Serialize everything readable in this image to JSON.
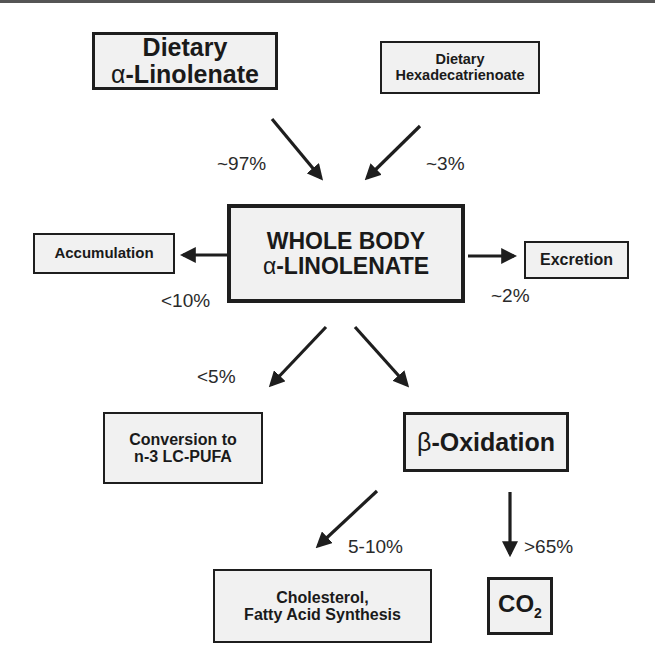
{
  "nodes": {
    "dietary_ala": {
      "line1": "Dietary",
      "line2_greek": "α",
      "line2": "-Linolenate"
    },
    "dietary_hexa": {
      "line1": "Dietary",
      "line2": "Hexadecatrienoate"
    },
    "whole_body": {
      "line1": "WHOLE BODY",
      "line2_greek": "α",
      "line2": "-LINOLENATE"
    },
    "accumulation": {
      "label": "Accumulation"
    },
    "excretion": {
      "label": "Excretion"
    },
    "conversion": {
      "line1": "Conversion to",
      "line2": "n-3 LC-PUFA"
    },
    "beta_ox": {
      "greek": "β",
      "label": "-Oxidation"
    },
    "cholesterol": {
      "line1": "Cholesterol,",
      "line2": "Fatty Acid Synthesis"
    },
    "co2": {
      "label": "CO",
      "sub": "2"
    }
  },
  "edges": {
    "ala_to_body": "~97%",
    "hexa_to_body": "~3%",
    "body_to_accumulation": "<10%",
    "body_to_excretion": "~2%",
    "body_to_conversion": "<5%",
    "betaox_to_cholesterol": "5-10%",
    "betaox_to_co2": ">65%"
  }
}
